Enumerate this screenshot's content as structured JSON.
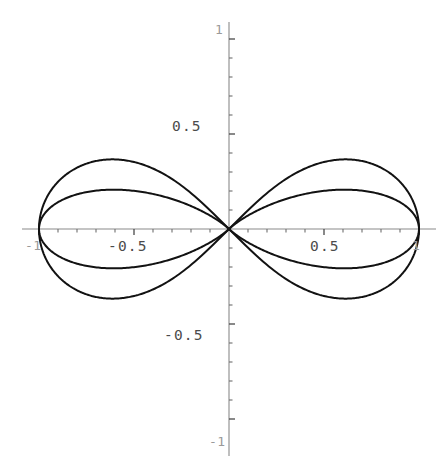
{
  "figure": {
    "background_color": "#ffffff",
    "curve_color": "#121212",
    "axis_color": "#8a8a8a",
    "label_color": "#4b4b4b",
    "width": 446,
    "height": 466
  },
  "chart_data": {
    "type": "line",
    "title": "",
    "subtitle": "",
    "xlabel": "",
    "ylabel": "",
    "coordinate_system": "polar",
    "grid": false,
    "legend": null,
    "xlim": [
      -1.1,
      1.12
    ],
    "ylim": [
      -1.12,
      1.12
    ],
    "aspect_ratio": "equal",
    "origin_px": [
      229,
      229
    ],
    "unit_radius_px": 190,
    "x_ticks": [
      -1,
      -0.5,
      0.5,
      1
    ],
    "y_ticks": [
      -1,
      -0.5,
      0.5,
      1
    ],
    "x_tick_labels": [
      "-1",
      "-0.5",
      "0.5",
      "1"
    ],
    "y_tick_labels": [
      "-1",
      "-0.5",
      "0.5",
      "1"
    ],
    "minor_tick_step": 0.1,
    "series": [
      {
        "name": "r = cos(2t)",
        "equation": "r = cos(2*theta)",
        "petals": 4,
        "max_radius": 1.0,
        "petal_angles_deg": [
          0,
          90,
          180,
          270
        ],
        "petal_width": "wide"
      },
      {
        "name": "r = cos(2t) narrow",
        "equation": "r = cos(2*theta)^3",
        "petals": 4,
        "max_radius": 1.0,
        "petal_angles_deg": [
          0,
          90,
          180,
          270
        ],
        "petal_width": "narrow"
      }
    ],
    "annotations": []
  },
  "labels": {
    "y_positive_half": "0.5",
    "y_negative_half": "-0.5",
    "y_positive_one": "1",
    "y_negative_one": "-1",
    "x_positive_half": "0.5",
    "x_negative_half": "-0.5",
    "x_positive_one": "1",
    "x_negative_one": "-1"
  }
}
